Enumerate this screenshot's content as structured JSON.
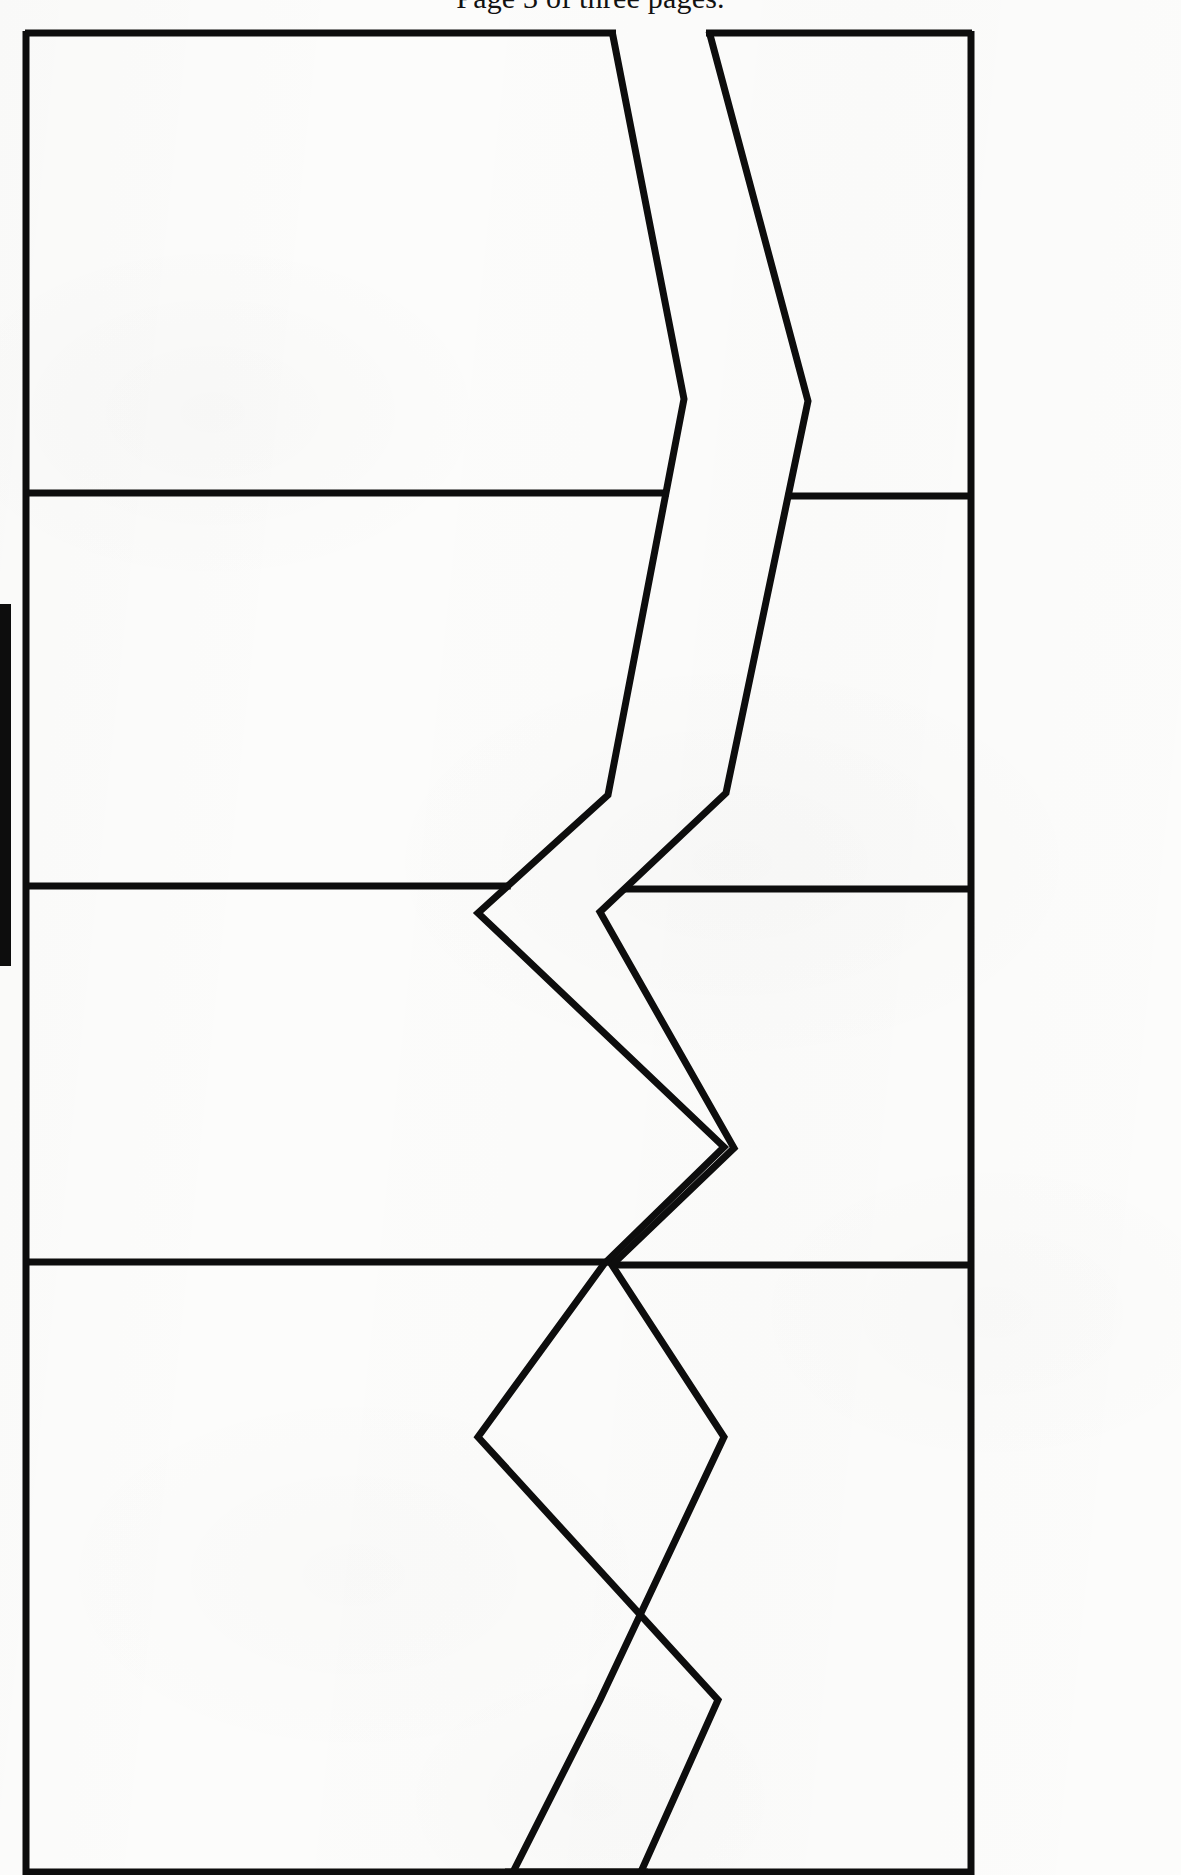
{
  "document": {
    "header_caption": "Page 3 of three pages.",
    "scan_background_color": "#fcfcfb",
    "ink_color": "#0d0d0d",
    "page_width": 1181,
    "page_height": 1875
  },
  "figure": {
    "name": "segmented-panel-with-zigzag-separation",
    "stroke_width": 7,
    "outline": {
      "left": 26,
      "right": 971,
      "top": 31,
      "bottom": 1874
    },
    "horizontal_dividers_y": [
      493,
      886,
      1262
    ],
    "band_count": 4,
    "separation_channel": {
      "type": "zigzag",
      "gap_width": 28,
      "left_edge_vertices": [
        [
          612,
          31
        ],
        [
          684,
          399
        ],
        [
          608,
          795
        ],
        [
          478,
          913
        ],
        [
          724,
          1147
        ],
        [
          604,
          1264
        ],
        [
          478,
          1437
        ],
        [
          718,
          1700
        ],
        [
          640,
          1874
        ]
      ],
      "right_edge_vertices": [
        [
          709,
          31
        ],
        [
          808,
          401
        ],
        [
          726,
          793
        ],
        [
          600,
          912
        ],
        [
          734,
          1148
        ],
        [
          612,
          1265
        ],
        [
          724,
          1437
        ],
        [
          600,
          1700
        ],
        [
          512,
          1874
        ]
      ]
    },
    "left_margin_mark": {
      "x": 0,
      "y": 604,
      "width": 11,
      "height": 362,
      "color": "#0d0d0d"
    }
  }
}
